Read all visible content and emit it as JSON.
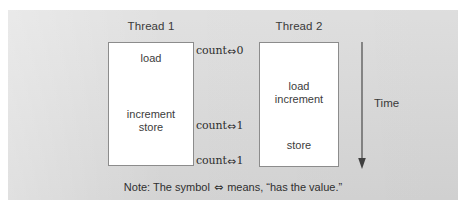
{
  "figure": {
    "background_color": "#d8d8d8",
    "box_fill": "#ffffff",
    "box_border_color": "#8c8c8c",
    "text_color": "#3a3a3a"
  },
  "columns": [
    {
      "id": "thread1",
      "title": "Thread 1",
      "operations": [
        {
          "id": "load",
          "text": "load"
        },
        {
          "id": "increment-store",
          "text": "increment\nstore"
        }
      ]
    },
    {
      "id": "thread2",
      "title": "Thread 2",
      "operations": [
        {
          "id": "load-increment",
          "text": "load\nincrement"
        },
        {
          "id": "store",
          "text": "store"
        }
      ]
    }
  ],
  "state_labels": [
    {
      "id": "state-0",
      "variable": "count",
      "symbol": "⇔",
      "value": "0",
      "text": "count⇔0"
    },
    {
      "id": "state-1",
      "variable": "count",
      "symbol": "⇔",
      "value": "1",
      "text": "count⇔1"
    },
    {
      "id": "state-2",
      "variable": "count",
      "symbol": "⇔",
      "value": "1",
      "text": "count⇔1"
    }
  ],
  "time_axis": {
    "label": "Time",
    "direction": "down",
    "arrow_color": "#4a4a4a"
  },
  "note": {
    "prefix": "Note: The symbol ",
    "symbol": "⇔",
    "suffix": " means, “has the value.”",
    "full_text": "Note: The symbol ⇔ means, “has the value.”"
  }
}
